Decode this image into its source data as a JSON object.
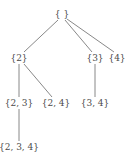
{
  "diagram": {
    "type": "tree",
    "title": "",
    "nodes": [
      {
        "id": "root",
        "label": "{ }",
        "x": 62,
        "y": 14
      },
      {
        "id": "n2",
        "label": "{2}",
        "x": 19,
        "y": 58
      },
      {
        "id": "n3",
        "label": "{3}",
        "x": 95,
        "y": 58
      },
      {
        "id": "n4",
        "label": "{4}",
        "x": 117,
        "y": 58
      },
      {
        "id": "n23",
        "label": "{2, 3}",
        "x": 19,
        "y": 103
      },
      {
        "id": "n24",
        "label": "{2, 4}",
        "x": 56,
        "y": 103
      },
      {
        "id": "n34",
        "label": "{3, 4}",
        "x": 95,
        "y": 103
      },
      {
        "id": "n234",
        "label": "{2, 3, 4}",
        "x": 19,
        "y": 147
      }
    ],
    "edges": [
      {
        "from": "root",
        "to": "n2",
        "x1": 58,
        "y1": 20,
        "x2": 24,
        "y2": 52
      },
      {
        "from": "root",
        "to": "n3",
        "x1": 65,
        "y1": 20,
        "x2": 92,
        "y2": 52
      },
      {
        "from": "root",
        "to": "n4",
        "x1": 67,
        "y1": 19,
        "x2": 114,
        "y2": 52
      },
      {
        "from": "n2",
        "to": "n23",
        "x1": 19,
        "y1": 64,
        "x2": 19,
        "y2": 97
      },
      {
        "from": "n2",
        "to": "n24",
        "x1": 24,
        "y1": 64,
        "x2": 52,
        "y2": 97
      },
      {
        "from": "n3",
        "to": "n34",
        "x1": 95,
        "y1": 64,
        "x2": 95,
        "y2": 97
      },
      {
        "from": "n23",
        "to": "n234",
        "x1": 19,
        "y1": 109,
        "x2": 19,
        "y2": 141
      }
    ]
  }
}
